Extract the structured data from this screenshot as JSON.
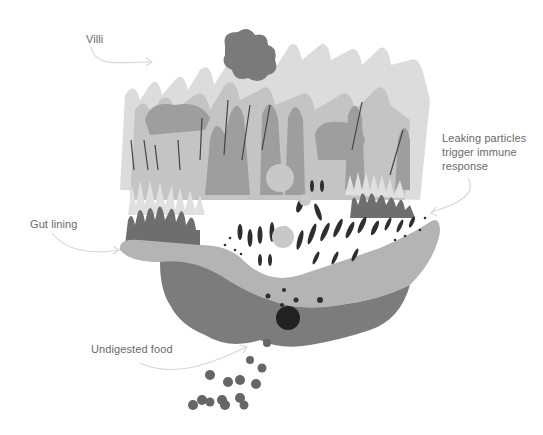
{
  "diagram": {
    "labels": {
      "villi": "Villi",
      "leaking_particles_line1": "Leaking particles",
      "leaking_particles_line2": "trigger immune",
      "leaking_particles_line3": "response",
      "gut_lining": "Gut lining",
      "undigested_food": "Undigested food"
    },
    "colors": {
      "background": "#ffffff",
      "villi_light": "#d6d6d6",
      "villi_mid": "#a8a8a8",
      "villi_dark": "#7a7a7a",
      "lining": "#b8b8b8",
      "tissue_dark": "#7c7c7c",
      "particles": "#3a3a3a",
      "food": "#666666",
      "arrow": "#d8d8d8",
      "label_text": "#6a6a6a"
    }
  }
}
